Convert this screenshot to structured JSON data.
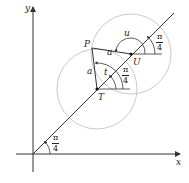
{
  "figure": {
    "axes": {
      "x_label": "x",
      "y_label": "y"
    },
    "points": {
      "P": "P",
      "T": "T",
      "U": "U"
    },
    "segment_labels": {
      "PU": "a",
      "PT": "a"
    },
    "angle_labels": {
      "t": "t",
      "u": "u"
    },
    "fractions": [
      {
        "num": "π",
        "den": "4"
      },
      {
        "num": "π",
        "den": "4"
      },
      {
        "num": "π",
        "den": "4"
      }
    ],
    "colors": {
      "line": "#333333",
      "circle": "#bbbbbb"
    }
  }
}
